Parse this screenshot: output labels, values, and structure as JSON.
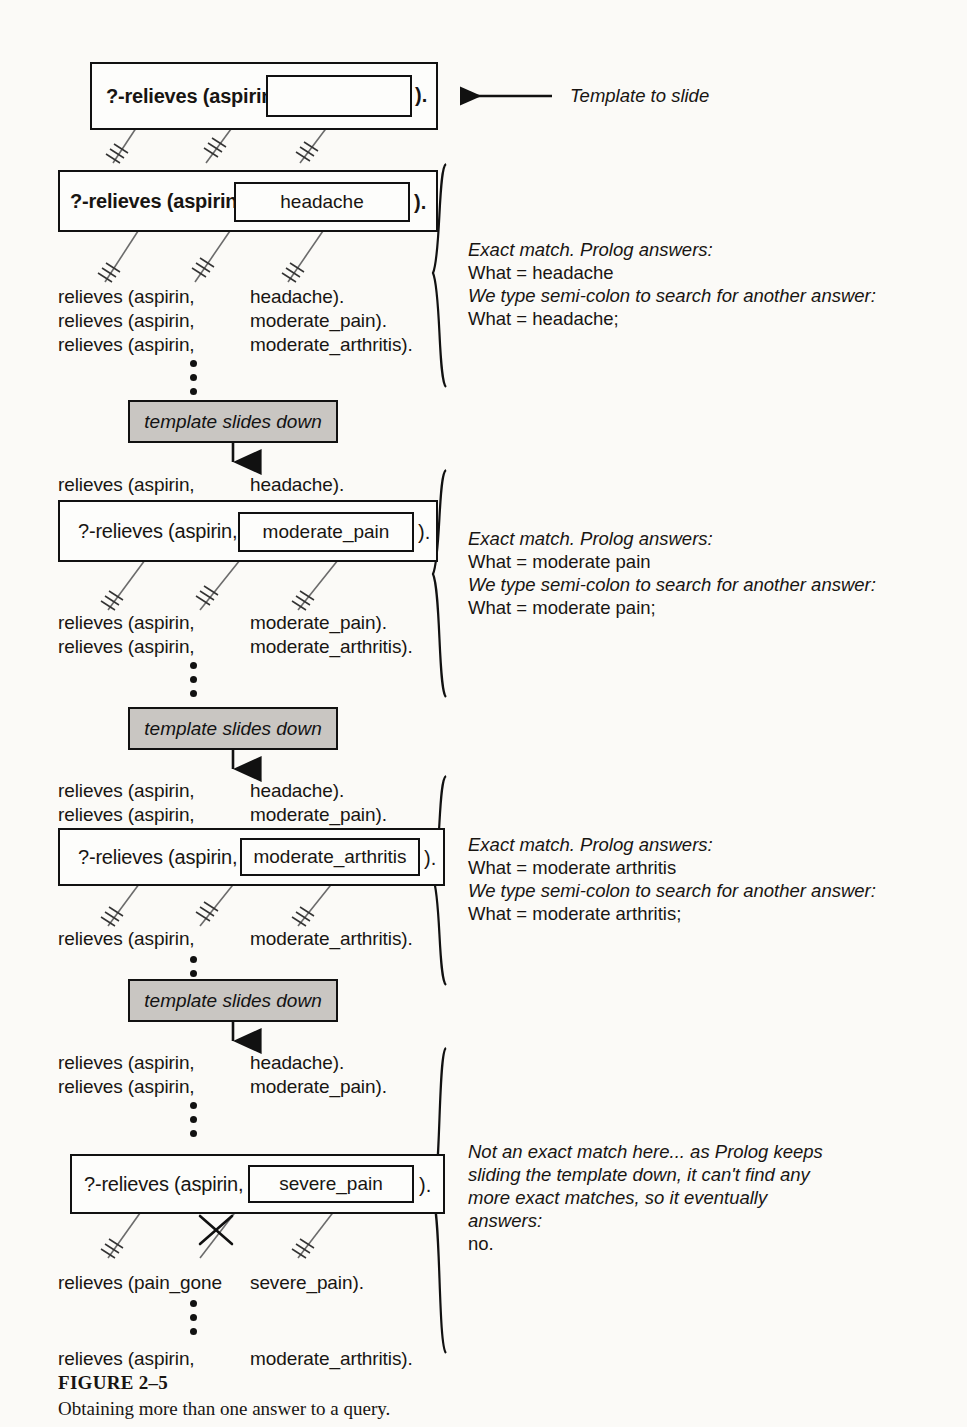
{
  "figure": {
    "label": "FIGURE 2–5",
    "caption": "Obtaining more than one answer to a query."
  },
  "colors": {
    "banner_fill": "#c9c6c2",
    "ink": "#111111",
    "paper": "#fbfaf7"
  },
  "banner_label": "template slides down",
  "top_annotation": "Template to slide",
  "stages": [
    {
      "id": "template",
      "query_prefix": "?-relieves (aspirin,",
      "slot_value": "",
      "query_suffix": ").",
      "facts_above": [],
      "facts_below": [],
      "note_lines": []
    },
    {
      "id": "match-headache",
      "query_prefix": "?-relieves (aspirin,",
      "slot_value": "headache",
      "query_suffix": ").",
      "facts_above": [],
      "facts_below": [
        {
          "left": "relieves (aspirin,",
          "right": "headache)."
        },
        {
          "left": "relieves (aspirin,",
          "right": "moderate_pain)."
        },
        {
          "left": "relieves (aspirin,",
          "right": "moderate_arthritis)."
        }
      ],
      "note_lines": [
        {
          "text": "Exact match.  Prolog answers:",
          "italic": true
        },
        {
          "text": "What = headache",
          "italic": false
        },
        {
          "text": "We type semi-colon to search for another answer:",
          "italic": true
        },
        {
          "text": "What = headache;",
          "italic": false
        }
      ]
    },
    {
      "id": "match-moderate-pain",
      "query_prefix": "?-relieves (aspirin,",
      "slot_value": "moderate_pain",
      "query_suffix": ").",
      "facts_above": [
        {
          "left": "relieves (aspirin,",
          "right": "headache)."
        }
      ],
      "facts_below": [
        {
          "left": "relieves (aspirin,",
          "right": "moderate_pain)."
        },
        {
          "left": "relieves (aspirin,",
          "right": "moderate_arthritis)."
        }
      ],
      "note_lines": [
        {
          "text": "Exact match.  Prolog answers:",
          "italic": true
        },
        {
          "text": "What = moderate pain",
          "italic": false
        },
        {
          "text": "We type semi-colon to search for another answer:",
          "italic": true
        },
        {
          "text": "What = moderate pain;",
          "italic": false
        }
      ]
    },
    {
      "id": "match-moderate-arthritis",
      "query_prefix": "?-relieves (aspirin,",
      "slot_value": "moderate_arthritis",
      "query_suffix": ").",
      "facts_above": [
        {
          "left": "relieves (aspirin,",
          "right": "headache)."
        },
        {
          "left": "relieves (aspirin,",
          "right": "moderate_pain)."
        }
      ],
      "facts_below": [
        {
          "left": "relieves (aspirin,",
          "right": "moderate_arthritis)."
        }
      ],
      "note_lines": [
        {
          "text": "Exact match.  Prolog answers:",
          "italic": true
        },
        {
          "text": "What = moderate arthritis",
          "italic": false
        },
        {
          "text": "We type semi-colon to search for another answer:",
          "italic": true
        },
        {
          "text": "What = moderate arthritis;",
          "italic": false
        }
      ]
    },
    {
      "id": "no-match-severe-pain",
      "query_prefix": "?-relieves (aspirin,",
      "slot_value": "severe_pain",
      "query_suffix": ").",
      "facts_above": [
        {
          "left": "relieves (aspirin,",
          "right": "headache)."
        },
        {
          "left": "relieves (aspirin,",
          "right": "moderate_pain)."
        }
      ],
      "facts_below": [
        {
          "left": "relieves (pain_gone",
          "right": "severe_pain)."
        },
        {
          "left": "relieves (aspirin,",
          "right": "moderate_arthritis)."
        }
      ],
      "note_lines": [
        {
          "text": "Not an exact match here... as Prolog keeps",
          "italic": true
        },
        {
          "text": "sliding the template down, it can't find any",
          "italic": true
        },
        {
          "text": "more exact matches, so it eventually",
          "italic": true
        },
        {
          "text": "answers:",
          "italic": true
        },
        {
          "text": "no.",
          "italic": false
        }
      ]
    }
  ],
  "text": {
    "s1_q_prefix": "?-relieves (aspirin,",
    "s1_q_suffix": ").",
    "s1_slot": "",
    "s2_q_prefix": "?-relieves (aspirin,",
    "s2_q_suffix": ").",
    "s2_slot": "headache",
    "s3_slot": "moderate_pain",
    "s4_slot": "moderate_arthritis",
    "s5_slot": "severe_pain",
    "q_prefix": "?-relieves (aspirin,",
    "q_suffix": ").",
    "fact_aspirin": "relieves (aspirin,",
    "fact_pain_gone": "relieves (pain_gone",
    "val_headache": "headache).",
    "val_moderate_pain": "moderate_pain).",
    "val_moderate_arthritis": "moderate_arthritis).",
    "val_severe_pain": "severe_pain).",
    "note2_l1": "Exact match.  Prolog answers:",
    "note2_l2": "What = headache",
    "note2_l3": "We type semi-colon to search for another answer:",
    "note2_l4": "What = headache;",
    "note3_l1": "Exact match.  Prolog answers:",
    "note3_l2": "What = moderate pain",
    "note3_l3": "We type semi-colon to search for another answer:",
    "note3_l4": "What = moderate pain;",
    "note4_l1": "Exact match.  Prolog answers:",
    "note4_l2": "What = moderate arthritis",
    "note4_l3": "We type semi-colon to search for another answer:",
    "note4_l4": "What = moderate arthritis;",
    "note5_l1": "Not an exact match here... as Prolog keeps",
    "note5_l2": "sliding the template down, it can't find any",
    "note5_l3": "more exact matches, so it eventually",
    "note5_l4": "answers:",
    "note5_l5": "no.",
    "banner": "template slides down",
    "template_arrow_label": "Template to slide"
  }
}
